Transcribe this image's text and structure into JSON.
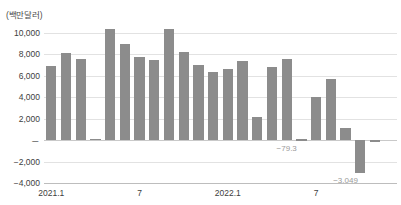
{
  "chart_data": {
    "type": "bar",
    "title": "",
    "subtitle": "",
    "unit_caption": "(백만달러)",
    "xlabel": "",
    "ylabel": "",
    "ylim": [
      -4000,
      10000
    ],
    "grid": true,
    "legend": null,
    "y_ticks": [
      {
        "value": 10000,
        "label": "10,000"
      },
      {
        "value": 8000,
        "label": "8,000"
      },
      {
        "value": 6000,
        "label": "6,000"
      },
      {
        "value": 4000,
        "label": "4,000"
      },
      {
        "value": 2000,
        "label": "2,000"
      },
      {
        "value": 0,
        "label": "－"
      },
      {
        "value": -2000,
        "label": "−2,000"
      },
      {
        "value": -4000,
        "label": "−4,000"
      }
    ],
    "x_ticks": [
      {
        "index": 0,
        "label": "2021.1"
      },
      {
        "index": 6,
        "label": "7"
      },
      {
        "index": 12,
        "label": "2022.1"
      },
      {
        "index": 18,
        "label": "7"
      }
    ],
    "categories": [
      "2021.1",
      "2021.2",
      "2021.3",
      "2021.4",
      "2021.5",
      "2021.6",
      "2021.7",
      "2021.8",
      "2021.9",
      "2021.10",
      "2021.11",
      "2021.12",
      "2022.1",
      "2022.2",
      "2022.3",
      "2022.4",
      "2022.5",
      "2022.6",
      "2022.7",
      "2022.8",
      "2022.9",
      "2022.10",
      "2022.11",
      "2022.12"
    ],
    "values": [
      6900,
      8100,
      7600,
      150,
      10350,
      9000,
      7800,
      7500,
      10400,
      8200,
      7000,
      6400,
      6600,
      7400,
      2200,
      6800,
      7600,
      100,
      4000,
      5700,
      1100,
      -3049,
      -79.3,
      0
    ],
    "bars": [
      {
        "category": "2021.1",
        "value": 6900,
        "label": null
      },
      {
        "category": "2021.2",
        "value": 8100,
        "label": null
      },
      {
        "category": "2021.3",
        "value": 7600,
        "label": null
      },
      {
        "category": "2021.4",
        "value": 150,
        "label": null
      },
      {
        "category": "2021.5",
        "value": 10350,
        "label": null
      },
      {
        "category": "2021.6",
        "value": 9000,
        "label": null
      },
      {
        "category": "2021.7",
        "value": 7800,
        "label": null
      },
      {
        "category": "2021.8",
        "value": 7500,
        "label": null
      },
      {
        "category": "2021.9",
        "value": 10400,
        "label": null
      },
      {
        "category": "2021.10",
        "value": 8200,
        "label": null
      },
      {
        "category": "2021.11",
        "value": 7000,
        "label": null
      },
      {
        "category": "2021.12",
        "value": 6400,
        "label": null
      },
      {
        "category": "2022.1",
        "value": 6600,
        "label": null
      },
      {
        "category": "2022.2",
        "value": 2200,
        "label": null
      },
      {
        "category": "2022.3",
        "value": 6800,
        "label": null
      },
      {
        "category": "2022.4",
        "value": 7400,
        "label": null
      },
      {
        "category": "2022.5",
        "value": -79.3,
        "label": "−79.3"
      },
      {
        "category": "2022.6",
        "value": 4000,
        "label": null
      },
      {
        "category": "2022.7",
        "value": 5700,
        "label": null
      },
      {
        "category": "2022.8",
        "value": 1100,
        "label": null
      },
      {
        "category": "2022.9",
        "value": -3049,
        "label": "−3,049"
      }
    ],
    "annotations": [
      {
        "text": "−79.3",
        "for_category": "2022.5"
      },
      {
        "text": "−3,049",
        "for_category": "2022.9"
      }
    ],
    "colors": {
      "bar": "#8c8c8c",
      "grid": "#e2e2e2",
      "zero_line": "#c9c9c9",
      "axis_text": "#3d3d3d",
      "data_label": "#9a9a9a",
      "background": "#ffffff"
    }
  }
}
